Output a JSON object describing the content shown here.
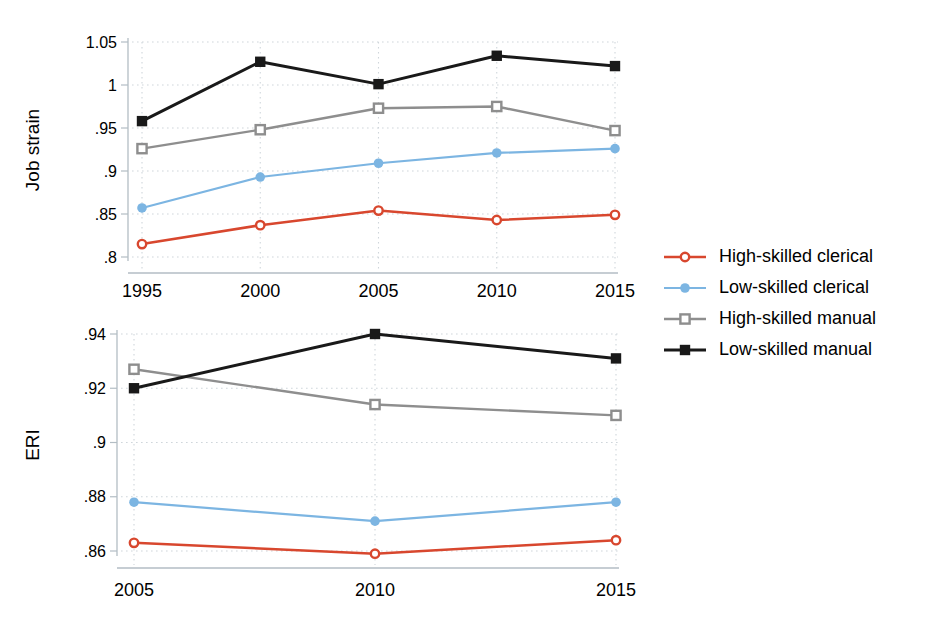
{
  "figure": {
    "background": "#ffffff"
  },
  "colors": {
    "axis_line": "#b3bdc4",
    "grid": "#cfd6db",
    "text": "#000000"
  },
  "legend": {
    "position": "right",
    "items": [
      {
        "label": "High-skilled clerical",
        "color": "#d8472e",
        "marker": "circle-open"
      },
      {
        "label": "Low-skilled clerical",
        "color": "#7cb5e2",
        "marker": "circle-filled"
      },
      {
        "label": "High-skilled manual",
        "color": "#8e8e8e",
        "marker": "square-open"
      },
      {
        "label": "Low-skilled manual",
        "color": "#191919",
        "marker": "square-filled"
      }
    ]
  },
  "chart_data": [
    {
      "type": "line",
      "ylabel": "Job strain",
      "x": [
        1995,
        2000,
        2005,
        2010,
        2015
      ],
      "xtick_labels": [
        "1995",
        "2000",
        "2005",
        "2010",
        "2015"
      ],
      "xlim": [
        1995,
        2015
      ],
      "ylim": [
        0.8,
        1.05
      ],
      "yticks": [
        0.8,
        0.85,
        0.9,
        0.95,
        1.0,
        1.05
      ],
      "ytick_labels": [
        ".8",
        ".85",
        ".9",
        ".95",
        "1",
        "1.05"
      ],
      "grid": true,
      "legend_position": "right-shared",
      "series": [
        {
          "name": "High-skilled clerical",
          "color": "#d8472e",
          "marker": "circle-open",
          "values": [
            0.815,
            0.837,
            0.854,
            0.843,
            0.849
          ]
        },
        {
          "name": "Low-skilled clerical",
          "color": "#7cb5e2",
          "marker": "circle-filled",
          "values": [
            0.857,
            0.893,
            0.909,
            0.921,
            0.926
          ]
        },
        {
          "name": "High-skilled manual",
          "color": "#8e8e8e",
          "marker": "square-open",
          "values": [
            0.926,
            0.948,
            0.973,
            0.975,
            0.947
          ]
        },
        {
          "name": "Low-skilled manual",
          "color": "#191919",
          "marker": "square-filled",
          "values": [
            0.958,
            1.027,
            1.001,
            1.034,
            1.022
          ]
        }
      ]
    },
    {
      "type": "line",
      "ylabel": "ERI",
      "x": [
        2005,
        2010,
        2015
      ],
      "xtick_labels": [
        "2005",
        "2010",
        "2015"
      ],
      "xlim": [
        2005,
        2015
      ],
      "ylim": [
        0.86,
        0.94
      ],
      "yticks": [
        0.86,
        0.88,
        0.9,
        0.92,
        0.94
      ],
      "ytick_labels": [
        ".86",
        ".88",
        ".9",
        ".92",
        ".94"
      ],
      "grid": true,
      "legend_position": "right-shared",
      "series": [
        {
          "name": "High-skilled clerical",
          "color": "#d8472e",
          "marker": "circle-open",
          "values": [
            0.863,
            0.859,
            0.864
          ]
        },
        {
          "name": "Low-skilled clerical",
          "color": "#7cb5e2",
          "marker": "circle-filled",
          "values": [
            0.878,
            0.871,
            0.878
          ]
        },
        {
          "name": "High-skilled manual",
          "color": "#8e8e8e",
          "marker": "square-open",
          "values": [
            0.927,
            0.914,
            0.91
          ]
        },
        {
          "name": "Low-skilled manual",
          "color": "#191919",
          "marker": "square-filled",
          "values": [
            0.92,
            0.94,
            0.931
          ]
        }
      ]
    }
  ]
}
